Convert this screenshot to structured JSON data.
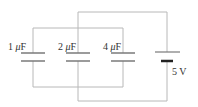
{
  "diagram": {
    "type": "circuit",
    "capacitors": [
      {
        "id": "c1",
        "value": "1",
        "unit_prefix": "μ",
        "unit": "F",
        "x": 33
      },
      {
        "id": "c2",
        "value": "2",
        "unit_prefix": "μ",
        "unit": "F",
        "x": 78
      },
      {
        "id": "c3",
        "value": "4",
        "unit_prefix": "μ",
        "unit": "F",
        "x": 123
      }
    ],
    "battery": {
      "label": "5 V",
      "x": 167
    },
    "colors": {
      "wire": "#b0b0b0",
      "plate": "#808080",
      "battery_short": "#222222",
      "text": "#333333"
    }
  }
}
